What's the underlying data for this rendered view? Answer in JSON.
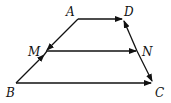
{
  "diagram": {
    "type": "trapezoid-vectors",
    "points": {
      "A": {
        "label": "A"
      },
      "D": {
        "label": "D"
      },
      "M": {
        "label": "M"
      },
      "N": {
        "label": "N"
      },
      "B": {
        "label": "B"
      },
      "C": {
        "label": "C"
      }
    },
    "edges": [
      {
        "from": "A",
        "to": "D",
        "arrow": "D"
      },
      {
        "from": "A",
        "to": "M",
        "arrow": "M"
      },
      {
        "from": "B",
        "to": "M",
        "arrow": "M"
      },
      {
        "from": "M",
        "to": "N",
        "arrow": "N"
      },
      {
        "from": "N",
        "to": "D",
        "arrow": "D"
      },
      {
        "from": "N",
        "to": "C",
        "arrow": "C"
      },
      {
        "from": "B",
        "to": "C",
        "arrow": "C"
      }
    ],
    "colors": {
      "stroke": "#111111",
      "background": "#ffffff"
    }
  }
}
